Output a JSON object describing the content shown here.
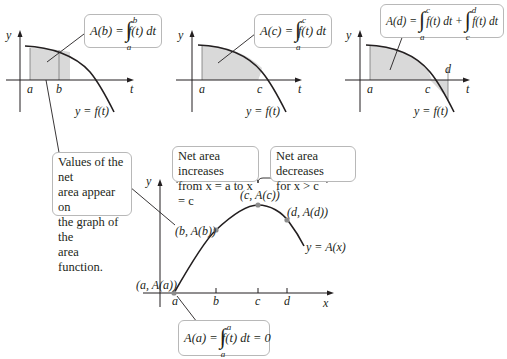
{
  "panels": [
    {
      "id": "panel-b",
      "formula": {
        "lhs": "A(b) =",
        "upper": "b",
        "lower": "a",
        "integrand": "f(t) dt"
      },
      "y_axis_label": "y",
      "t_axis_label": "t",
      "ticks": [
        "a",
        "b"
      ],
      "curve_label": "y = f(t)"
    },
    {
      "id": "panel-c",
      "formula": {
        "lhs": "A(c) =",
        "upper": "c",
        "lower": "a",
        "integrand": "f(t) dt"
      },
      "y_axis_label": "y",
      "t_axis_label": "t",
      "ticks": [
        "a",
        "c"
      ],
      "curve_label": "y = f(t)"
    },
    {
      "id": "panel-d",
      "formula": {
        "lhs": "A(d) =",
        "upper": "c",
        "lower": "a",
        "integrand": "f(t) dt +",
        "upper2": "d",
        "lower2": "c",
        "integrand2": "f(t) dt"
      },
      "y_axis_label": "y",
      "t_axis_label": "t",
      "ticks": [
        "a",
        "c",
        "d"
      ],
      "curve_label": "y = f(t)"
    }
  ],
  "notes": {
    "values_note": "Values of the net area appear on the graph of the area function.",
    "values_lines": [
      "Values of the net",
      "area appear on",
      "the graph of the",
      "area function."
    ],
    "increase_lines": [
      "Net area increases",
      "from x = a to x = c"
    ],
    "decrease_lines": [
      "Net area decreases",
      "for x > c"
    ]
  },
  "area_graph": {
    "y_axis_label": "y",
    "x_axis_label": "x",
    "ticks": [
      "a",
      "b",
      "c",
      "d"
    ],
    "points": [
      "(a, A(a))",
      "(b, A(b))",
      "(c, A(c))",
      "(d, A(d))"
    ],
    "curve_label": "y = A(x)",
    "bottom_formula": {
      "lhs": "A(a) =",
      "upper": "a",
      "lower": "a",
      "integrand": "f(t) dt = 0"
    }
  },
  "colors": {
    "curve": "#231f20",
    "shade": "#d9d9d9",
    "box_border": "#b8b8b8",
    "point": "#8c8c8c"
  }
}
